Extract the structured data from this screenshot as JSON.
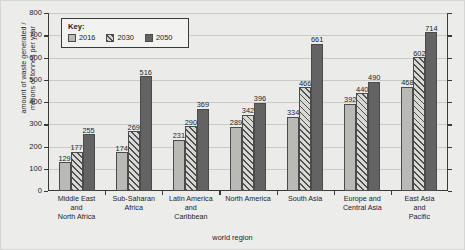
{
  "chart_data": {
    "type": "bar",
    "title": "",
    "xlabel": "world region",
    "ylabel": "amount of waste generated /\nmillions of tonnes per year",
    "ylim": [
      0,
      800
    ],
    "yticks": [
      0,
      100,
      200,
      300,
      400,
      500,
      600,
      700,
      800
    ],
    "grid": true,
    "legend_title": "Key:",
    "legend_position": "upper-left-inside",
    "categories": [
      "Middle East\nand\nNorth Africa",
      "Sub-Saharan\nAfrica",
      "Latin America\nand\nCaribbean",
      "North America",
      "South Asia",
      "Europe and\nCentral Asia",
      "East Asia\nand\nPacific"
    ],
    "series": [
      {
        "name": "2016",
        "color": "#b9b9b5",
        "fill": "solid-light-grey",
        "values": [
          129,
          174,
          231,
          289,
          334,
          392,
          468
        ]
      },
      {
        "name": "2030",
        "color": "#d8d8d4",
        "fill": "diagonal-hatch",
        "values": [
          177,
          269,
          290,
          342,
          466,
          440,
          602
        ]
      },
      {
        "name": "2050",
        "color": "#636363",
        "fill": "solid-dark-grey",
        "values": [
          255,
          516,
          369,
          396,
          661,
          490,
          714
        ]
      }
    ]
  }
}
